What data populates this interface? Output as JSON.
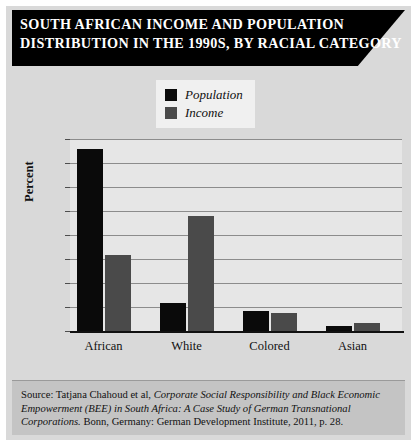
{
  "title": {
    "line1": "SOUTH AFRICAN INCOME AND POPULATION",
    "line2": "DISTRIBUTION IN THE 1990S, BY RACIAL CATEGORY"
  },
  "legend": {
    "position": "top-center",
    "items": [
      {
        "label": "Population",
        "color": "#0a0a0a",
        "swatch_name": "legend-swatch-population"
      },
      {
        "label": "Income",
        "color": "#4a4a4a",
        "swatch_name": "legend-swatch-income"
      }
    ]
  },
  "source": {
    "prefix": "Source: Tatjana Chahoud et al, ",
    "italic1": "Corporate Social Responsibility and Black Economic Empowerment (BEE) in South Africa: A Case Study of German Transnational Corporations.",
    "suffix": " Bonn, Germany: German Development Institute, 2011, p. 28."
  },
  "colors": {
    "banner_background": "#000000",
    "banner_text": "#ffffff",
    "figure_background": "#d9d9d9",
    "plot_background": "#e6e6e6",
    "gridline": "#8c8c8c",
    "axis": "#111111",
    "population_bar": "#0a0a0a",
    "income_bar": "#4a4a4a",
    "source_background": "#c4c4c4"
  },
  "chart_data": {
    "type": "bar",
    "title": "SOUTH AFRICAN INCOME AND POPULATION DISTRIBUTION IN THE 1990S, BY RACIAL CATEGORY",
    "xlabel": "",
    "ylabel": "Percent",
    "categories": [
      "African",
      "White",
      "Colored",
      "Asian"
    ],
    "series": [
      {
        "name": "Population",
        "values": [
          76,
          11.5,
          8.5,
          2
        ]
      },
      {
        "name": "Income",
        "values": [
          31.5,
          48,
          7.5,
          3.5
        ]
      }
    ],
    "ylim": [
      0,
      80
    ],
    "yticks": [
      0,
      10,
      20,
      30,
      40,
      50,
      60,
      70,
      80
    ],
    "ytick_labels": [
      "0",
      "10",
      "20",
      "30",
      "40",
      "50",
      "60",
      "70",
      "80"
    ],
    "grid": "horizontal",
    "legend_position": "top-center"
  }
}
